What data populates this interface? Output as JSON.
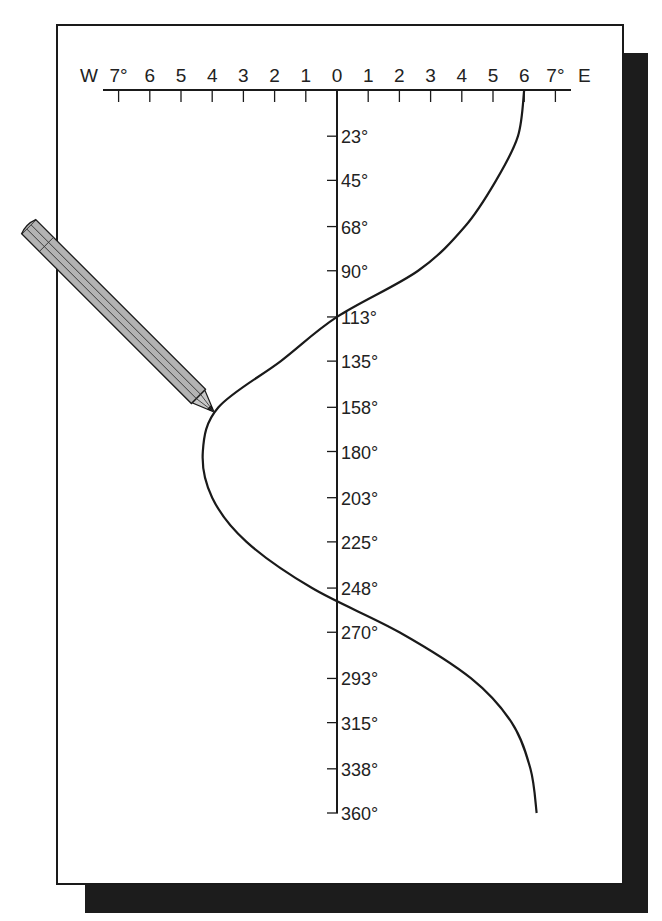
{
  "figure": {
    "colors": {
      "ink": "#1a1a1a",
      "shadow": "#1c1c1c",
      "pencil": "#b3b3b3",
      "paper": "#ffffff"
    }
  },
  "horizontal_axis": {
    "west_label": "W",
    "east_label": "E",
    "ticks": [
      "7°",
      "6",
      "5",
      "4",
      "3",
      "2",
      "1",
      "0",
      "1",
      "2",
      "3",
      "4",
      "5",
      "6",
      "7°"
    ],
    "tick_values": [
      -7,
      -6,
      -5,
      -4,
      -3,
      -2,
      -1,
      0,
      1,
      2,
      3,
      4,
      5,
      6,
      7
    ]
  },
  "vertical_axis": {
    "ticks": [
      "23°",
      "45°",
      "68°",
      "90°",
      "113°",
      "135°",
      "158°",
      "180°",
      "203°",
      "225°",
      "248°",
      "270°",
      "293°",
      "315°",
      "338°",
      "360°"
    ]
  },
  "chart_data": {
    "type": "line",
    "title": "",
    "xlabel": "Deviation (W negative, E positive, degrees)",
    "ylabel": "Compass heading (degrees)",
    "orientation": "vertical heading axis, horizontal deviation axis",
    "xlim": [
      -7,
      7
    ],
    "ylim": [
      0,
      360
    ],
    "grid": false,
    "legend": "none",
    "x_tick_labels": [
      "W 7°",
      "6",
      "5",
      "4",
      "3",
      "2",
      "1",
      "0",
      "1",
      "2",
      "3",
      "4",
      "5",
      "6",
      "7° E"
    ],
    "y_tick_labels": [
      "23°",
      "45°",
      "68°",
      "90°",
      "113°",
      "135°",
      "158°",
      "180°",
      "203°",
      "225°",
      "248°",
      "270°",
      "293°",
      "315°",
      "338°",
      "360°"
    ],
    "series": [
      {
        "name": "deviation curve",
        "heading": [
          0,
          23,
          45,
          68,
          90,
          113,
          135,
          158,
          180,
          203,
          225,
          248,
          270,
          293,
          315,
          338,
          360
        ],
        "deviation": [
          6.0,
          5.8,
          5.1,
          4.1,
          2.6,
          0.0,
          -1.8,
          -3.8,
          -4.3,
          -4.0,
          -2.9,
          -0.8,
          2.0,
          4.3,
          5.6,
          6.2,
          6.4
        ]
      }
    ]
  }
}
